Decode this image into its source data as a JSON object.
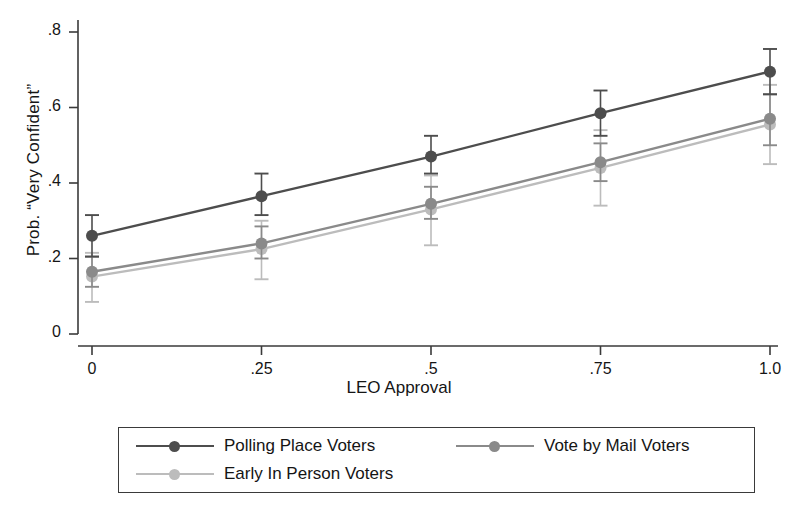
{
  "chart_data": {
    "type": "line",
    "title": "",
    "xlabel": "LEO Approval",
    "ylabel": "Prob. “Very Confident”",
    "x": [
      0,
      0.25,
      0.5,
      0.75,
      1.0
    ],
    "xtick_labels": [
      "0",
      ".25",
      ".5",
      ".75",
      "1.0"
    ],
    "ytick_labels": [
      "0",
      ".2",
      ".4",
      ".6",
      ".8"
    ],
    "ytick_values": [
      0,
      0.2,
      0.4,
      0.6,
      0.8
    ],
    "xlim": [
      0,
      1.0
    ],
    "ylim": [
      0,
      0.8
    ],
    "grid": false,
    "legend_position": "bottom",
    "error_bars": true,
    "series": [
      {
        "name": "Polling Place Voters",
        "color": "#4d4d4d",
        "values": [
          0.26,
          0.365,
          0.47,
          0.585,
          0.695
        ],
        "err_low": [
          0.205,
          0.315,
          0.425,
          0.525,
          0.635
        ],
        "err_high": [
          0.315,
          0.425,
          0.525,
          0.645,
          0.755
        ]
      },
      {
        "name": "Vote by Mail Voters",
        "color": "#8a8a8a",
        "values": [
          0.165,
          0.24,
          0.345,
          0.455,
          0.57
        ],
        "err_low": [
          0.125,
          0.2,
          0.305,
          0.405,
          0.5
        ],
        "err_high": [
          0.205,
          0.285,
          0.39,
          0.505,
          0.635
        ]
      },
      {
        "name": "Early In Person Voters",
        "color": "#bcbcbc",
        "values": [
          0.152,
          0.225,
          0.33,
          0.44,
          0.555
        ],
        "err_low": [
          0.085,
          0.145,
          0.235,
          0.34,
          0.45
        ],
        "err_high": [
          0.215,
          0.3,
          0.42,
          0.54,
          0.66
        ]
      }
    ]
  },
  "legend": {
    "entries": [
      {
        "label": "Polling Place Voters",
        "color": "#4d4d4d"
      },
      {
        "label": "Vote by Mail Voters",
        "color": "#8a8a8a"
      },
      {
        "label": "Early In Person Voters",
        "color": "#bcbcbc"
      }
    ]
  },
  "axes": {
    "x_title": "LEO Approval",
    "y_title": "Prob. “Very Confident”",
    "axis_color": "#3a3a3a"
  }
}
